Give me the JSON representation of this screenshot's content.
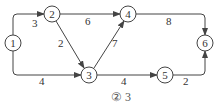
{
  "diagram": {
    "type": "directed-weighted-graph",
    "nodes": [
      {
        "id": "1",
        "label": "1"
      },
      {
        "id": "2",
        "label": "2"
      },
      {
        "id": "3",
        "label": "3"
      },
      {
        "id": "4",
        "label": "4"
      },
      {
        "id": "5",
        "label": "5"
      },
      {
        "id": "6",
        "label": "6"
      }
    ],
    "edges": [
      {
        "from": "1",
        "to": "2",
        "weight": "3"
      },
      {
        "from": "1",
        "to": "3",
        "weight": "4"
      },
      {
        "from": "2",
        "to": "4",
        "weight": "6"
      },
      {
        "from": "2",
        "to": "3",
        "weight": "2"
      },
      {
        "from": "3",
        "to": "4",
        "weight": "7"
      },
      {
        "from": "3",
        "to": "5",
        "weight": "4"
      },
      {
        "from": "4",
        "to": "6",
        "weight": "8"
      },
      {
        "from": "5",
        "to": "6",
        "weight": "2"
      }
    ],
    "caption": "② 3"
  }
}
